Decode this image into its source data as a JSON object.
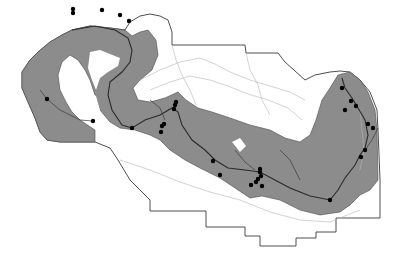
{
  "map": {
    "type": "grayscale thematic map",
    "colors": {
      "background": "#ffffff",
      "region_fill": "#8c8c8c",
      "boundary": "#3a3a3a",
      "river": "#2a2a2a",
      "contour": "#b5b5b5",
      "point": "#000000"
    },
    "features": {
      "boundary": "outer administrative boundary with stepped southern edge",
      "shaded_area": "gray shaded zone following main river corridor",
      "river": "main river winding west to east with tributaries",
      "contours": "light gray contour / drainage lines",
      "points": "black dot sample sites along river"
    },
    "points": [
      [
        73,
        9
      ],
      [
        73,
        13
      ],
      [
        102,
        10
      ],
      [
        120,
        15
      ],
      [
        129,
        21
      ],
      [
        47,
        99
      ],
      [
        93,
        121
      ],
      [
        132,
        128
      ],
      [
        162,
        126
      ],
      [
        175,
        105
      ],
      [
        174,
        109
      ],
      [
        176,
        102
      ],
      [
        164,
        124
      ],
      [
        161,
        132
      ],
      [
        213,
        161
      ],
      [
        220,
        175
      ],
      [
        260,
        169
      ],
      [
        260,
        172
      ],
      [
        261,
        176
      ],
      [
        251,
        185
      ],
      [
        256,
        182
      ],
      [
        258,
        179
      ],
      [
        262,
        186
      ],
      [
        330,
        200
      ],
      [
        342,
        88
      ],
      [
        351,
        101
      ],
      [
        345,
        110
      ],
      [
        356,
        106
      ],
      [
        361,
        157
      ],
      [
        365,
        150
      ],
      [
        368,
        124
      ],
      [
        373,
        128
      ]
    ]
  }
}
